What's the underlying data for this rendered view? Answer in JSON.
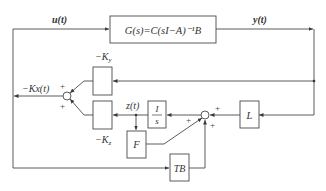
{
  "diagram": {
    "plant_block": "G(s)=C(sI−A)⁻¹B",
    "signals": {
      "input": "u(t)",
      "output": "y(t)",
      "state_feedback": "−Kx(t)",
      "integrator_state": "z(t)"
    },
    "blocks": {
      "ky_label": "−K",
      "ky_sub": "y",
      "kz_label": "−K",
      "kz_sub": "z",
      "integrator_num": "I",
      "integrator_den": "s",
      "f": "F",
      "l": "L",
      "tb": "TB"
    },
    "sum_signs": {
      "left_top": "+",
      "left_bottom": "+",
      "right_from_l": "+",
      "right_from_f": "+",
      "right_from_tb": "+"
    },
    "colors": {
      "stroke": "#4a4a4a",
      "text": "#333333"
    }
  }
}
